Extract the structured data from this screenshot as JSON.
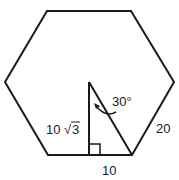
{
  "diagram": {
    "shape": "regular hexagon",
    "labels": {
      "side": "20",
      "base_half": "10",
      "height_num": "10",
      "height_root": "3",
      "angle": "30°"
    },
    "colors": {
      "stroke": "#1a1a1a",
      "background": "#ffffff"
    }
  }
}
